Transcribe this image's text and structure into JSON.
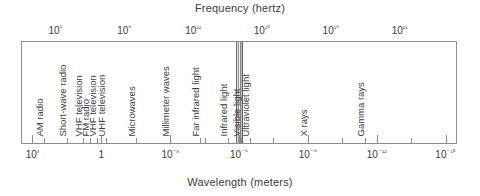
{
  "figure": {
    "type": "electromagnetic-spectrum-diagram",
    "top_axis_title": "Frequency (hertz)",
    "bottom_axis_title": "Wavelength (meters)"
  },
  "chart_data": {
    "type": "bar",
    "xlabel": "Wavelength (meters)",
    "ylabel": "",
    "grid": false,
    "legend": "none",
    "orientation": "horizontal-log-scale",
    "top_axis": {
      "label": "Frequency (hertz)",
      "scale": "log10",
      "unit": "hertz",
      "range_exponents": [
        4.5,
        22.5
      ],
      "tick_labels": [
        "10⁶",
        "10⁹",
        "10¹²",
        "10¹⁵",
        "10¹⁸",
        "10²¹"
      ],
      "tick_exponents": [
        6,
        9,
        12,
        15,
        18,
        21
      ],
      "minor_ticks_per_decade": 1
    },
    "bottom_axis": {
      "label": "Wavelength (meters)",
      "scale": "log10",
      "unit": "meters",
      "range_exponents": [
        3.5,
        -15.5
      ],
      "tick_labels": [
        "10³",
        "1",
        "10⁻³",
        "10⁻⁶",
        "10⁻⁹",
        "10⁻¹²",
        "10⁻¹⁵"
      ],
      "tick_exponents": [
        3,
        0,
        -3,
        -6,
        -9,
        -12,
        -15
      ],
      "minor_ticks_per_decade": 1
    },
    "categories": [
      "AM radio",
      "Short-wave radio",
      "VHF television",
      "FM radio",
      "VHF television",
      "UHF television",
      "Microwaves",
      "Millimeter waves",
      "Far infrared light",
      "Infrared light",
      "Visible light",
      "Ultraviolet light",
      "X rays",
      "Gamma rays"
    ],
    "values": [
      6,
      7,
      7.7,
      8,
      8.3,
      8.7,
      10,
      11.5,
      12.8,
      14,
      14.6,
      15,
      17.5,
      20
    ],
    "bands": [
      {
        "label": "AM radio",
        "frequency_exponent": 6.0,
        "wavelength_exponent": 2.5
      },
      {
        "label": "Short-wave radio",
        "frequency_exponent": 7.0,
        "wavelength_exponent": 1.5
      },
      {
        "label": "VHF television",
        "frequency_exponent": 7.7,
        "wavelength_exponent": 0.8
      },
      {
        "label": "FM radio",
        "frequency_exponent": 8.0,
        "wavelength_exponent": 0.5
      },
      {
        "label": "VHF television",
        "frequency_exponent": 8.3,
        "wavelength_exponent": 0.2
      },
      {
        "label": "UHF television",
        "frequency_exponent": 8.7,
        "wavelength_exponent": -0.2
      },
      {
        "label": "Microwaves",
        "frequency_exponent": 10.0,
        "wavelength_exponent": -1.5
      },
      {
        "label": "Millimeter waves",
        "frequency_exponent": 11.5,
        "wavelength_exponent": -3.0
      },
      {
        "label": "Far infrared light",
        "frequency_exponent": 12.8,
        "wavelength_exponent": -4.3
      },
      {
        "label": "Infrared light",
        "frequency_exponent": 14.0,
        "wavelength_exponent": -5.5
      },
      {
        "label": "Visible light",
        "frequency_exponent": 14.6,
        "wavelength_exponent": -6.1,
        "highlighted": true
      },
      {
        "label": "Ultraviolet light",
        "frequency_exponent": 15.0,
        "wavelength_exponent": -6.5
      },
      {
        "label": "X rays",
        "frequency_exponent": 17.5,
        "wavelength_exponent": -9.0
      },
      {
        "label": "Gamma rays",
        "frequency_exponent": 20.0,
        "wavelength_exponent": -11.5
      }
    ],
    "visible_light_band": {
      "label": "Visible light",
      "highlight_color": "#6f6f6f",
      "center_wavelength_exponent": -6.2
    }
  }
}
